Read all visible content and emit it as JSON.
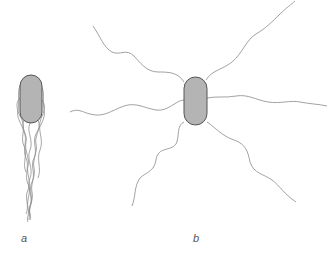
{
  "figure": {
    "panels": [
      {
        "id": "a",
        "label": "a",
        "description": "Bacterium with polar tuft of flagella (lophotrichous)"
      },
      {
        "id": "b",
        "label": "b",
        "description": "Bacterium with peritrichous flagella"
      }
    ],
    "colors": {
      "cell_fill": "#b4b4b4",
      "cell_stroke": "#555555",
      "flagella": "#8a8a8a",
      "background": "#ffffff"
    }
  }
}
